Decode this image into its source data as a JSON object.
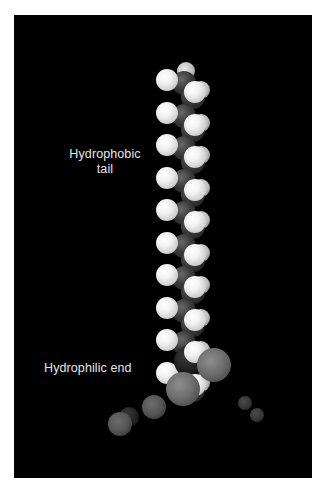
{
  "figure": {
    "background_color": "#000000",
    "frame_color": "#ffffff",
    "labels": {
      "tail": "Hydrophobic tail",
      "tail_line1": "Hydrophobic",
      "tail_line2": "tail",
      "end": "Hydrophilic end"
    },
    "molecule": {
      "model": "space-filling",
      "tail_carbon_units": 10,
      "head_oxygen_atoms": 2,
      "surrounding_water_molecules": 2
    },
    "colors": {
      "hydrogen": "#f2f2f2",
      "carbon": "#2a2a2a",
      "oxygen": "#7a7a7a",
      "label_text": "#e6e6e6"
    }
  }
}
